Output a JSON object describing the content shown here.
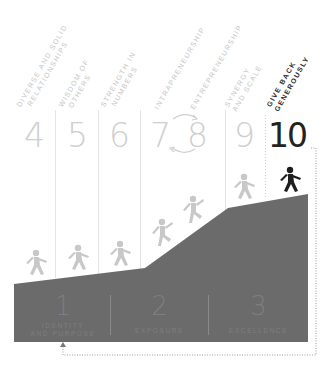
{
  "diagram": {
    "steps": [
      {
        "number": "4",
        "label_line1": "DIVERSE AND SOLID",
        "label_line2": "RELATIONSHIPS",
        "active": false
      },
      {
        "number": "5",
        "label_line1": "WISDOM OF",
        "label_line2": "OTHERS",
        "active": false
      },
      {
        "number": "6",
        "label_line1": "STRENGTH IN",
        "label_line2": "NUMBERS",
        "active": false
      },
      {
        "number": "7",
        "label_line1": "INTRAPRENEURSHIP",
        "label_line2": "",
        "active": false
      },
      {
        "number": "8",
        "label_line1": "ENTREPRENEURSHIP",
        "label_line2": "",
        "active": false
      },
      {
        "number": "9",
        "label_line1": "SYNERGY",
        "label_line2": "AND SCALE",
        "active": false
      },
      {
        "number": "10",
        "label_line1": "GIVE BACK",
        "label_line2": "GENEROUSLY",
        "active": true
      }
    ],
    "stages": [
      {
        "number": "1",
        "label_line1": "IDENTITY",
        "label_line2": "AND PURPOSE"
      },
      {
        "number": "2",
        "label_line1": "EXPOSURE",
        "label_line2": ""
      },
      {
        "number": "3",
        "label_line1": "EXCELLENCE",
        "label_line2": ""
      }
    ],
    "colors": {
      "mountain": "#6b6b6b",
      "figure_inactive": "#c8c8c8",
      "figure_active": "#1e1e1e",
      "divider": "#e4e4e4",
      "number_inactive": "#cfcfcf",
      "number_active": "#222222",
      "stage_text": "#7e7e7e",
      "loop_line": "#9a9a9a"
    }
  }
}
